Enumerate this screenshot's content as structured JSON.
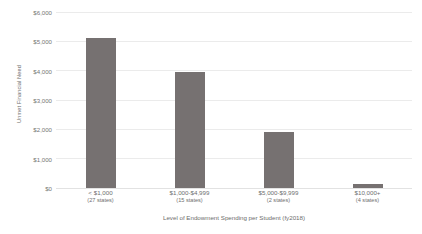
{
  "chart_data": {
    "type": "bar",
    "title": "",
    "xlabel": "Level of Endowment Spending per Student (fy2018)",
    "ylabel": "Unmet Financial Need",
    "categories": [
      "< $1,000",
      "$1,000-$4,999",
      "$5,000-$9,999",
      "$10,000+"
    ],
    "category_sublabels": [
      "(27 states)",
      "(15 states)",
      "(2 states)",
      "(4 states)"
    ],
    "values": [
      5120,
      3950,
      1900,
      150
    ],
    "ylim": [
      0,
      6000
    ],
    "ytick_values": [
      0,
      1000,
      2000,
      3000,
      4000,
      5000,
      6000
    ],
    "ytick_labels": [
      "$0",
      "$1,000",
      "$2,000",
      "$3,000",
      "$4,000",
      "$5,000",
      "$6,000"
    ],
    "grid": "horizontal",
    "legend": "none",
    "bar_color": "#767171",
    "gridline_color": "#ebebeb",
    "background_color": "#ffffff"
  }
}
